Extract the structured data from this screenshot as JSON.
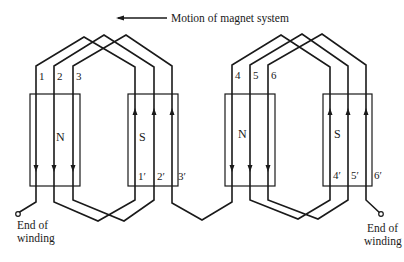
{
  "title": "Motion of magnet system",
  "direction_arrow": "arrow-left-icon",
  "groups": [
    {
      "north_label": "N",
      "south_label": "S",
      "coil_start_labels": [
        "1",
        "2",
        "3"
      ],
      "coil_end_labels": [
        "1′",
        "2′",
        "3′"
      ]
    },
    {
      "north_label": "N",
      "south_label": "S",
      "coil_start_labels": [
        "4",
        "5",
        "6"
      ],
      "coil_end_labels": [
        "4′",
        "5′",
        "6′"
      ]
    }
  ],
  "terminals": {
    "left": {
      "line1": "End of",
      "line2": "winding"
    },
    "right": {
      "line1": "End of",
      "line2": "winding"
    }
  },
  "colors": {
    "line": "#1a1a1a",
    "background": "#ffffff"
  }
}
